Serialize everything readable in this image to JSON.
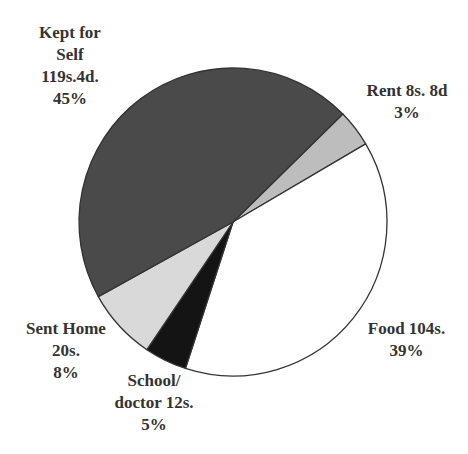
{
  "chart_data": {
    "type": "pie",
    "title": "",
    "center": [
      233,
      222
    ],
    "radius": 154,
    "start_angle_deg": 45.5,
    "slices": [
      {
        "name": "Rent",
        "amount": "8s. 8d",
        "percent": 3,
        "start": 45.5,
        "end": 59.5,
        "color": "#bdbdbd"
      },
      {
        "name": "Food",
        "amount": "104s.",
        "percent": 39,
        "start": 59.5,
        "end": 198,
        "color": "#ffffff"
      },
      {
        "name": "School/ doctor",
        "amount": "12s.",
        "percent": 5,
        "start": 198,
        "end": 214,
        "color": "#141414"
      },
      {
        "name": "Sent Home",
        "amount": "20s.",
        "percent": 8,
        "start": 214,
        "end": 241,
        "color": "#d9d9d9"
      },
      {
        "name": "Kept for Self",
        "amount": "119s.4d.",
        "percent": 45,
        "start": 241,
        "end": 405.5,
        "color": "#4a4a4a"
      }
    ],
    "outline_color": "#333333"
  },
  "labels": {
    "self": [
      "Kept for",
      "Self",
      "119s.4d.",
      "45%"
    ],
    "rent": [
      "Rent 8s. 8d",
      "3%"
    ],
    "food": [
      "Food 104s.",
      "39%"
    ],
    "school": [
      "School/",
      "doctor 12s.",
      "5%"
    ],
    "sent": [
      "Sent Home",
      "20s.",
      "8%"
    ]
  }
}
